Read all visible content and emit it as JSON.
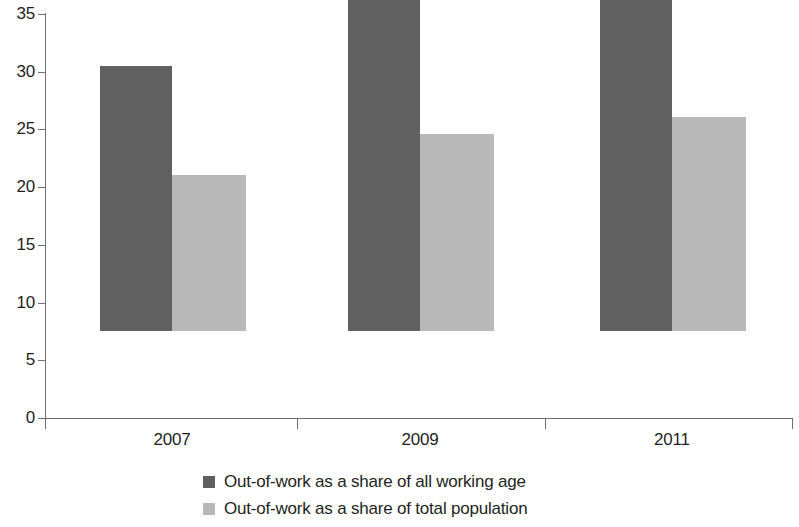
{
  "chart_data": {
    "type": "bar",
    "title": "",
    "subtitle": "",
    "xlabel": "",
    "ylabel": "",
    "categories": [
      "2007",
      "2009",
      "2011"
    ],
    "series": [
      {
        "name": "Out-of-work as a share of all working age",
        "color": "#606060",
        "values": [
          23,
          29,
          32
        ]
      },
      {
        "name": "Out-of-work as a share of total population",
        "color": "#b8b8b8",
        "values": [
          13.5,
          17.1,
          18.5
        ]
      }
    ],
    "ylim": [
      0,
      35
    ],
    "ytick_labels": [
      "0",
      "5",
      "10",
      "15",
      "20",
      "25",
      "30",
      "35"
    ],
    "ytick_values": [
      0,
      5,
      10,
      15,
      20,
      25,
      30,
      35
    ],
    "grid": false,
    "legend_position": "bottom-center",
    "axis_color": "#6d6e71"
  },
  "legend": {
    "items": [
      {
        "label": "Out-of-work as a share of all working age",
        "swatch": "dark"
      },
      {
        "label": "Out-of-work as a share of total population",
        "swatch": "light"
      }
    ]
  }
}
